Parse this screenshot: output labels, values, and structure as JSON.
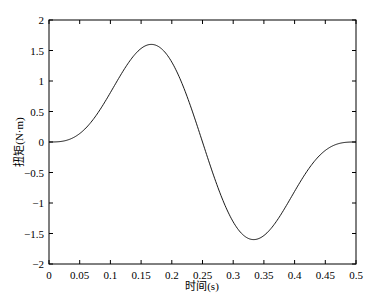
{
  "chart_data": {
    "type": "line",
    "title": "",
    "xlabel": "时间(s)",
    "ylabel": "扭矩(N·m)",
    "xlim": [
      0,
      0.5
    ],
    "ylim": [
      -2,
      2
    ],
    "grid": false,
    "xticks": [
      "0",
      "0.05",
      "0.1",
      "0.15",
      "0.2",
      "0.25",
      "0.3",
      "0.35",
      "0.4",
      "0.45",
      "0.5"
    ],
    "yticks": [
      "2",
      "1.5",
      "1",
      "0.5",
      "0",
      "-0.5",
      "-1",
      "-1.5",
      "-2"
    ],
    "series": [
      {
        "name": "torque",
        "color": "#000000",
        "x": [
          0,
          0.025,
          0.05,
          0.075,
          0.1,
          0.125,
          0.15,
          0.155,
          0.175,
          0.2,
          0.225,
          0.25,
          0.275,
          0.3,
          0.325,
          0.345,
          0.35,
          0.375,
          0.4,
          0.425,
          0.45,
          0.475,
          0.5
        ],
        "y": [
          0,
          0.03,
          0.21,
          0.59,
          1.08,
          1.23,
          1.59,
          1.6,
          1.52,
          1.11,
          0.57,
          0,
          -0.57,
          -1.11,
          -1.52,
          -1.6,
          -1.59,
          -1.23,
          -1.08,
          -0.59,
          -0.21,
          -0.03,
          0
        ]
      }
    ]
  }
}
